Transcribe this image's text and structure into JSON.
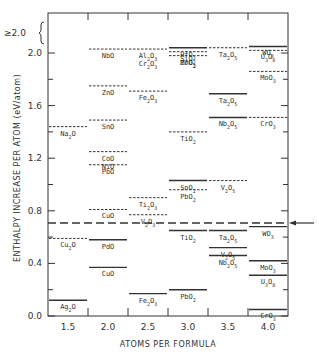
{
  "chart_data": {
    "type": "scatter",
    "subtype": "energy-level diagram",
    "title": "",
    "xlabel": "ATOMS PER FORMULA",
    "ylabel": "ENTHALPY INCREASE PER ATOM (eV/atom)",
    "categories": [
      "1.5",
      "2.0",
      "2.5",
      "3.0",
      "3.5",
      "4.0"
    ],
    "ylim": [
      0.0,
      2.2
    ],
    "yticks": [
      "0.0",
      "0.4",
      "0.8",
      "1.2",
      "1.6",
      "2.0"
    ],
    "ytop_label": "≥2.0",
    "reference_line": {
      "value": 0.71,
      "style": "dashed",
      "arrow": "right-pointing-left"
    },
    "series": [
      {
        "name": "dashed",
        "points": [
          {
            "x": "1.5",
            "label": "Cu2O",
            "value": 0.59
          },
          {
            "x": "1.5",
            "label": "Na2O",
            "value": 1.44
          },
          {
            "x": "2.0",
            "label": "NbO",
            "value": 2.03
          },
          {
            "x": "2.0",
            "label": "ZnO",
            "value": 1.75
          },
          {
            "x": "2.0",
            "label": "SnO",
            "value": 1.49
          },
          {
            "x": "2.0",
            "label": "CoO / NiO",
            "value": 1.25
          },
          {
            "x": "2.0",
            "label": "PbO",
            "value": 1.15
          },
          {
            "x": "2.0",
            "label": "CuO",
            "value": 0.81
          },
          {
            "x": "2.5",
            "label": "Al2O3 / Cr2O3",
            "value": 2.03
          },
          {
            "x": "2.5",
            "label": "Fe2O3",
            "value": 1.71
          },
          {
            "x": "2.5",
            "label": "Ti2O3",
            "value": 0.9
          },
          {
            "x": "2.5",
            "label": "V2O3",
            "value": 0.77
          },
          {
            "x": "3.0",
            "label": "SiO2",
            "value": 2.01
          },
          {
            "x": "3.0",
            "label": "MoO2",
            "value": 1.98
          },
          {
            "x": "3.0",
            "label": "TiO2",
            "value": 1.4
          },
          {
            "x": "3.0",
            "label": "PbO2",
            "value": 0.96
          },
          {
            "x": "3.5",
            "label": "Ta2O5",
            "value": 2.04
          },
          {
            "x": "3.5",
            "label": "V2O5",
            "value": 1.03
          },
          {
            "x": "4.0",
            "label": "U3O8",
            "value": 2.02
          },
          {
            "x": "4.0",
            "label": "MoO3",
            "value": 1.86
          },
          {
            "x": "4.0",
            "label": "CrO3",
            "value": 1.51
          }
        ]
      },
      {
        "name": "solid",
        "points": [
          {
            "x": "1.5",
            "label": "Ag2O",
            "value": 0.12
          },
          {
            "x": "2.0",
            "label": "PdO",
            "value": 0.58
          },
          {
            "x": "2.0",
            "label": "CuO",
            "value": 0.37
          },
          {
            "x": "2.5",
            "label": "Fe2O3",
            "value": 0.17
          },
          {
            "x": "3.0",
            "label": "HfO2 / ZrO2",
            "value": 2.04
          },
          {
            "x": "3.0",
            "label": "SnO2",
            "value": 1.03
          },
          {
            "x": "3.0",
            "label": "TiO2",
            "value": 0.65
          },
          {
            "x": "3.0",
            "label": "PbO2",
            "value": 0.2
          },
          {
            "x": "3.5",
            "label": "Ta2O5",
            "value": 1.69
          },
          {
            "x": "3.5",
            "label": "Nb2O5",
            "value": 1.51
          },
          {
            "x": "3.5",
            "label": "Ta2O5",
            "value": 0.65
          },
          {
            "x": "3.5",
            "label": "V2O5",
            "value": 0.52
          },
          {
            "x": "3.5",
            "label": "Nb2O5",
            "value": 0.46
          },
          {
            "x": "4.0",
            "label": "WO3",
            "value": 2.05
          },
          {
            "x": "4.0",
            "label": "WO3",
            "value": 0.68
          },
          {
            "x": "4.0",
            "label": "MoO3",
            "value": 0.42
          },
          {
            "x": "4.0",
            "label": "U3O8",
            "value": 0.31
          },
          {
            "x": "4.0",
            "label": "CrO3",
            "value": 0.05
          }
        ]
      }
    ],
    "legend": "solid lines vs dashed lines (no legend box)",
    "grid": false
  },
  "axes": {
    "xlabel": "ATOMS PER FORMULA",
    "ylabel": "ENTHALPY INCREASE PER ATOM (eV/atom)",
    "xticks": [
      "1.5",
      "2.0",
      "2.5",
      "3.0",
      "3.5",
      "4.0"
    ],
    "yticks": [
      "0.0",
      "0.4",
      "0.8",
      "1.2",
      "1.6",
      "2.0"
    ],
    "ytop": "≥2.0"
  }
}
